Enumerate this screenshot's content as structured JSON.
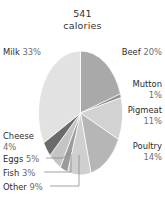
{
  "chart_data": {
    "type": "pie",
    "title": "541 calories",
    "title_lines": [
      "541",
      "calories"
    ],
    "xlabel": "",
    "ylabel": "",
    "legend_position": "labels-around-pie",
    "grid": false,
    "unit": "%",
    "total_label": "541",
    "total_unit": "calories",
    "categories": [
      "Beef",
      "Mutton",
      "Pigmeat",
      "Poultry",
      "Other",
      "Fish",
      "Eggs",
      "Cheese",
      "Milk"
    ],
    "values": [
      20,
      1,
      11,
      14,
      9,
      3,
      5,
      4,
      33
    ],
    "slices": [
      {
        "name": "Beef",
        "label": "Beef",
        "value": 20,
        "pct_text": "20%",
        "color": "#a9a9a9"
      },
      {
        "name": "Mutton",
        "label": "Mutton",
        "value": 1,
        "pct_text": "1%",
        "color": "#8f8f8f"
      },
      {
        "name": "Pigmeat",
        "label": "Pigmeat",
        "value": 11,
        "pct_text": "11%",
        "color": "#d2d2d2"
      },
      {
        "name": "Poultry",
        "label": "Poultry",
        "value": 14,
        "pct_text": "14%",
        "color": "#b6b6b6"
      },
      {
        "name": "Other",
        "label": "Other",
        "value": 9,
        "pct_text": "9%",
        "color": "#cfcfcf"
      },
      {
        "name": "Fish",
        "label": "Fish",
        "value": 3,
        "pct_text": "3%",
        "color": "#9b9b9b"
      },
      {
        "name": "Eggs",
        "label": "Eggs",
        "value": 5,
        "pct_text": "5%",
        "color": "#c4c4c4"
      },
      {
        "name": "Cheese",
        "label": "Cheese",
        "value": 4,
        "pct_text": "4%",
        "color": "#6b6b6b"
      },
      {
        "name": "Milk",
        "label": "Milk",
        "value": 33,
        "pct_text": "33%",
        "color": "#e2e2e2"
      }
    ]
  },
  "labels": {
    "milk": {
      "name": "Milk 33%",
      "text": "Milk ",
      "pct": "33%"
    },
    "beef": {
      "name": "Beef 20%",
      "text": "Beef ",
      "pct": "20%"
    },
    "mutton": {
      "name": "Mutton 1%",
      "line1": "Mutton",
      "pct": "1%"
    },
    "pigmeat": {
      "name": "Pigmeat 11%",
      "line1": "Pigmeat",
      "pct": "11%"
    },
    "poultry": {
      "name": "Poultry 14%",
      "line1": "Poultry",
      "pct": "14%"
    },
    "cheese": {
      "name": "Cheese 4%",
      "line1": "Cheese",
      "pct": "4%"
    },
    "eggs": {
      "name": "Eggs 5%",
      "text": "Eggs ",
      "pct": "5%"
    },
    "fish": {
      "name": "Fish 3%",
      "text": "Fish ",
      "pct": "3%"
    },
    "other": {
      "name": "Other 9%",
      "text": "Other ",
      "pct": "9%"
    }
  },
  "colors": {
    "background": "#ffffff",
    "text": "#2b2b2b",
    "muted_text": "#6e6e6e",
    "leader_line": "#8a8a8a"
  }
}
